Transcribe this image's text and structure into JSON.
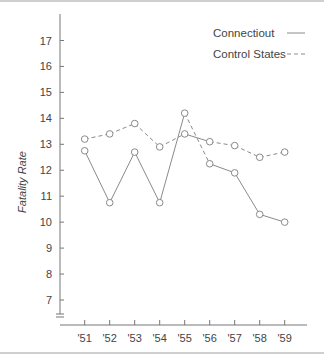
{
  "chart_data": {
    "type": "line",
    "title": "",
    "xlabel": "",
    "ylabel": "Fatality Rate",
    "ylim": [
      6.2,
      18
    ],
    "yticks": [
      7,
      8,
      9,
      10,
      11,
      12,
      13,
      14,
      15,
      16,
      17
    ],
    "categories": [
      "'51",
      "'52",
      "'53",
      "'54",
      "'55",
      "'56",
      "'57",
      "'58",
      "'59"
    ],
    "grid": false,
    "legend_position": "top-right",
    "axis_break": true,
    "series": [
      {
        "name": "Connectiout",
        "style": "solid",
        "values": [
          12.75,
          10.75,
          12.7,
          10.75,
          14.2,
          12.25,
          11.9,
          10.3,
          10.0
        ]
      },
      {
        "name": "Control States",
        "style": "dashed",
        "values": [
          13.2,
          13.4,
          13.8,
          12.9,
          13.4,
          13.1,
          12.95,
          12.5,
          12.7
        ]
      }
    ],
    "colors": {
      "line": "#8a8a8a",
      "marker_fill": "#ffffff",
      "text": "#444444",
      "axis": "#777777"
    }
  }
}
